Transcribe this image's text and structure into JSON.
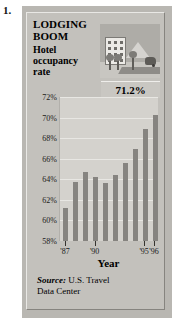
{
  "list_number": "1.",
  "headline": {
    "line1": "LODGING",
    "line2": "BOOM",
    "line3": "Hotel",
    "line4": "occupancy",
    "line5": "rate"
  },
  "illustration": {
    "name": "hotel-street-scene-illustration",
    "elements": [
      "hotel-building",
      "mountain",
      "trees",
      "road",
      "car"
    ]
  },
  "callout": {
    "value_label": "71.2%"
  },
  "source": {
    "prefix": "Source:",
    "text": " U.S. Travel",
    "line2": "Data Center"
  },
  "colors": {
    "frame": "#b9b7b2",
    "panel": "#c3c1bc",
    "plot_bg": "#d4d2cd",
    "bar": "#868480",
    "gridline": "#e8e7e3",
    "text": "#000000"
  },
  "chart_data": {
    "type": "bar",
    "title": "LODGING BOOM Hotel occupancy rate",
    "xlabel": "Year",
    "ylabel": "",
    "ylim": [
      58,
      72
    ],
    "yticks": [
      58,
      60,
      62,
      64,
      66,
      68,
      70,
      72
    ],
    "ytick_labels": [
      "58%",
      "60%",
      "62%",
      "64%",
      "66%",
      "68%",
      "70%",
      "72%"
    ],
    "grid": true,
    "legend": "none",
    "categories": [
      "'87",
      "'88",
      "'89",
      "'90",
      "'91",
      "'92",
      "'93",
      "'94",
      "'95",
      "'96"
    ],
    "xtick_labels": [
      "'87",
      "'90",
      "'95",
      "'96"
    ],
    "xtick_categories": [
      "'87",
      "'90",
      "'95",
      "'96"
    ],
    "values": [
      61.2,
      63.7,
      64.7,
      64.2,
      63.6,
      64.4,
      65.6,
      66.9,
      68.9,
      70.3
    ],
    "annotations": [
      {
        "text": "71.2%",
        "note": "callout value shown above chart"
      }
    ],
    "source": "Source: U.S. Travel Data Center"
  }
}
